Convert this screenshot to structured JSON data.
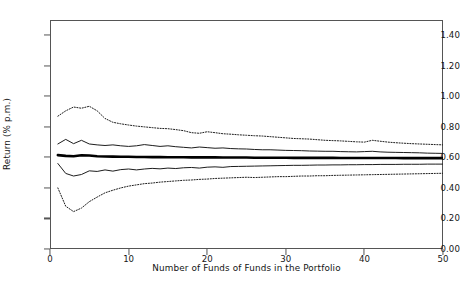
{
  "chart_data": {
    "type": "line",
    "title": "",
    "xlabel": "Number of Funds of Funds in the Portfolio",
    "ylabel": "Return (% p.m.)",
    "xlim": [
      0,
      50
    ],
    "ylim": [
      0.0,
      1.5
    ],
    "xticks": [
      0,
      10,
      20,
      30,
      40,
      50
    ],
    "xtick_labels": [
      "0",
      "10",
      "20",
      "30",
      "40",
      "50"
    ],
    "yticks": [
      0.0,
      0.2,
      0.4,
      0.6,
      0.8,
      1.0,
      1.2,
      1.4
    ],
    "ytick_labels": [
      "0.00",
      "0.20",
      "0.40",
      "0.60",
      "0.80",
      "1.00",
      "1.20",
      "1.40"
    ],
    "grid": false,
    "legend": "none",
    "x": [
      1,
      2,
      3,
      4,
      5,
      6,
      7,
      8,
      9,
      10,
      11,
      12,
      13,
      14,
      15,
      16,
      17,
      18,
      19,
      20,
      21,
      22,
      23,
      24,
      25,
      26,
      27,
      28,
      29,
      30,
      31,
      32,
      33,
      34,
      35,
      36,
      37,
      38,
      39,
      40,
      41,
      42,
      43,
      44,
      45,
      46,
      47,
      48,
      49,
      50
    ],
    "series": [
      {
        "name": "upper-extreme",
        "style": "dotted",
        "values": [
          0.87,
          0.905,
          0.93,
          0.922,
          0.935,
          0.905,
          0.855,
          0.83,
          0.82,
          0.812,
          0.805,
          0.8,
          0.795,
          0.79,
          0.788,
          0.782,
          0.775,
          0.762,
          0.758,
          0.768,
          0.762,
          0.755,
          0.752,
          0.748,
          0.745,
          0.742,
          0.74,
          0.736,
          0.732,
          0.728,
          0.724,
          0.722,
          0.72,
          0.716,
          0.712,
          0.71,
          0.708,
          0.705,
          0.702,
          0.7,
          0.712,
          0.706,
          0.7,
          0.696,
          0.693,
          0.69,
          0.688,
          0.686,
          0.684,
          0.682
        ]
      },
      {
        "name": "upper-quartile",
        "style": "solid",
        "values": [
          0.688,
          0.718,
          0.69,
          0.712,
          0.688,
          0.682,
          0.678,
          0.682,
          0.676,
          0.672,
          0.676,
          0.684,
          0.678,
          0.672,
          0.676,
          0.67,
          0.666,
          0.662,
          0.668,
          0.664,
          0.66,
          0.662,
          0.658,
          0.656,
          0.655,
          0.652,
          0.65,
          0.65,
          0.648,
          0.646,
          0.645,
          0.644,
          0.642,
          0.641,
          0.64,
          0.64,
          0.638,
          0.637,
          0.636,
          0.638,
          0.64,
          0.636,
          0.634,
          0.633,
          0.632,
          0.631,
          0.63,
          0.628,
          0.627,
          0.626
        ]
      },
      {
        "name": "mean",
        "style": "thick-solid",
        "values": [
          0.615,
          0.61,
          0.608,
          0.614,
          0.612,
          0.608,
          0.606,
          0.605,
          0.604,
          0.604,
          0.603,
          0.603,
          0.602,
          0.602,
          0.601,
          0.601,
          0.601,
          0.6,
          0.6,
          0.6,
          0.6,
          0.599,
          0.599,
          0.599,
          0.599,
          0.598,
          0.598,
          0.598,
          0.598,
          0.598,
          0.597,
          0.597,
          0.597,
          0.597,
          0.597,
          0.597,
          0.596,
          0.596,
          0.596,
          0.596,
          0.596,
          0.596,
          0.596,
          0.596,
          0.595,
          0.595,
          0.595,
          0.595,
          0.595,
          0.595
        ]
      },
      {
        "name": "lower-quartile",
        "style": "solid",
        "values": [
          0.56,
          0.495,
          0.478,
          0.488,
          0.512,
          0.508,
          0.518,
          0.51,
          0.52,
          0.524,
          0.518,
          0.524,
          0.528,
          0.525,
          0.53,
          0.527,
          0.532,
          0.534,
          0.53,
          0.536,
          0.538,
          0.535,
          0.54,
          0.541,
          0.542,
          0.543,
          0.544,
          0.545,
          0.546,
          0.547,
          0.548,
          0.548,
          0.549,
          0.55,
          0.55,
          0.551,
          0.551,
          0.552,
          0.552,
          0.553,
          0.553,
          0.554,
          0.554,
          0.554,
          0.555,
          0.555,
          0.555,
          0.556,
          0.556,
          0.556
        ]
      },
      {
        "name": "lower-extreme",
        "style": "dotted",
        "values": [
          0.4,
          0.28,
          0.245,
          0.268,
          0.31,
          0.34,
          0.368,
          0.385,
          0.4,
          0.412,
          0.42,
          0.428,
          0.432,
          0.438,
          0.442,
          0.446,
          0.45,
          0.452,
          0.456,
          0.458,
          0.462,
          0.464,
          0.466,
          0.468,
          0.47,
          0.468,
          0.47,
          0.472,
          0.474,
          0.474,
          0.476,
          0.478,
          0.478,
          0.48,
          0.48,
          0.482,
          0.483,
          0.484,
          0.485,
          0.486,
          0.487,
          0.488,
          0.489,
          0.49,
          0.491,
          0.492,
          0.493,
          0.494,
          0.495,
          0.496
        ]
      }
    ]
  }
}
